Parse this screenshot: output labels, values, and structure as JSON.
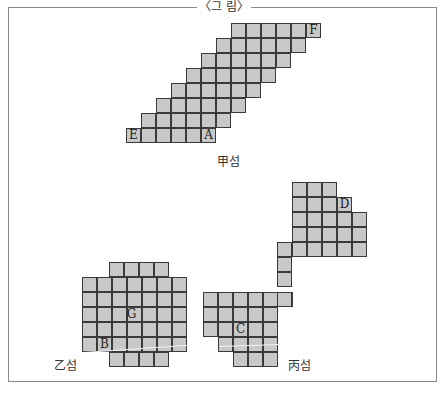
{
  "figure": {
    "title": "〈그 림〉",
    "cell_size": 15,
    "colors": {
      "cell_fill": "#c8c8c8",
      "cell_border": "#3a3a3a",
      "frame": "#8a8a8a"
    }
  },
  "islands": [
    {
      "name": "甲섬",
      "caption": {
        "text": "甲섬",
        "x": 217,
        "y": 152
      },
      "rows": [
        {
          "y": 23,
          "x0": 231,
          "count": 6
        },
        {
          "y": 38,
          "x0": 216,
          "count": 6
        },
        {
          "y": 53,
          "x0": 201,
          "count": 6
        },
        {
          "y": 68,
          "x0": 186,
          "count": 6
        },
        {
          "y": 83,
          "x0": 171,
          "count": 6
        },
        {
          "y": 98,
          "x0": 156,
          "count": 6
        },
        {
          "y": 113,
          "x0": 141,
          "count": 6
        },
        {
          "y": 128,
          "x0": 126,
          "count": 6
        }
      ],
      "labels": [
        {
          "text": "F",
          "x": 306,
          "y": 23
        },
        {
          "text": "E",
          "x": 126,
          "y": 128
        },
        {
          "text": "A",
          "x": 201,
          "y": 128
        }
      ]
    },
    {
      "name": "乙섬",
      "caption": {
        "text": "乙섬",
        "x": 54,
        "y": 356
      },
      "rows": [
        {
          "y": 262,
          "x0": 109,
          "count": 4
        },
        {
          "y": 277,
          "x0": 82,
          "count": 7
        },
        {
          "y": 292,
          "x0": 82,
          "count": 7
        },
        {
          "y": 307,
          "x0": 82,
          "count": 7
        },
        {
          "y": 322,
          "x0": 82,
          "count": 7
        },
        {
          "y": 337,
          "x0": 82,
          "count": 7
        },
        {
          "y": 352,
          "x0": 109,
          "count": 4
        }
      ],
      "labels": [
        {
          "text": "G",
          "x": 124,
          "y": 307
        },
        {
          "text": "B",
          "x": 97,
          "y": 337
        }
      ]
    },
    {
      "name": "丙섬",
      "caption": {
        "text": "丙섬",
        "x": 288,
        "y": 356
      },
      "rows": [
        {
          "y": 182,
          "x0": 292,
          "count": 3
        },
        {
          "y": 197,
          "x0": 292,
          "count": 4
        },
        {
          "y": 212,
          "x0": 292,
          "count": 5
        },
        {
          "y": 227,
          "x0": 292,
          "count": 5
        },
        {
          "y": 242,
          "x0": 277,
          "count": 6
        },
        {
          "y": 257,
          "x0": 277,
          "count": 1
        },
        {
          "y": 272,
          "x0": 277,
          "count": 1
        },
        {
          "y": 292,
          "x0": 203,
          "count": 6
        },
        {
          "y": 307,
          "x0": 203,
          "count": 5
        },
        {
          "y": 322,
          "x0": 203,
          "count": 5
        },
        {
          "y": 337,
          "x0": 218,
          "count": 4
        },
        {
          "y": 352,
          "x0": 233,
          "count": 3
        }
      ],
      "extra_rows": [
        {
          "y": 292,
          "x0": 277,
          "count": 1
        }
      ],
      "labels": [
        {
          "text": "D",
          "x": 337,
          "y": 197
        },
        {
          "text": "C",
          "x": 233,
          "y": 322
        }
      ]
    }
  ]
}
